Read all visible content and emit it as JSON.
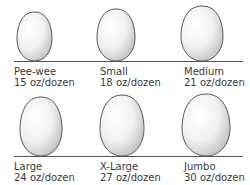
{
  "colors": {
    "egg_fill_light": "#ffffff",
    "egg_fill_dark": "#c8c8c8",
    "egg_outline": "#555555",
    "baseline": "#555555",
    "text": "#3a3a3a"
  },
  "rows": [
    {
      "baseline_y": 61,
      "eggs": [
        {
          "size": "Pee-wee",
          "weight": "15 oz/dozen",
          "cx": 34.5,
          "rx": 17.5,
          "ry": 24.5,
          "label_x": 14
        },
        {
          "size": "Small",
          "weight": "18 oz/dozen",
          "cx": 116,
          "rx": 19,
          "ry": 26,
          "label_x": 100
        },
        {
          "size": "Medium",
          "weight": "21 oz/dozen",
          "cx": 202,
          "rx": 21,
          "ry": 27.5,
          "label_x": 184
        }
      ]
    },
    {
      "baseline_y": 156,
      "eggs": [
        {
          "size": "Large",
          "weight": "24 oz/dozen",
          "cx": 41,
          "rx": 21,
          "ry": 29.5,
          "label_x": 14
        },
        {
          "size": "X-Large",
          "weight": "27 oz/dozen",
          "cx": 122,
          "rx": 22,
          "ry": 30.5,
          "label_x": 100
        },
        {
          "size": "Jumbo",
          "weight": "30 oz/dozen",
          "cx": 206,
          "rx": 24,
          "ry": 31,
          "label_x": 184
        }
      ]
    }
  ]
}
